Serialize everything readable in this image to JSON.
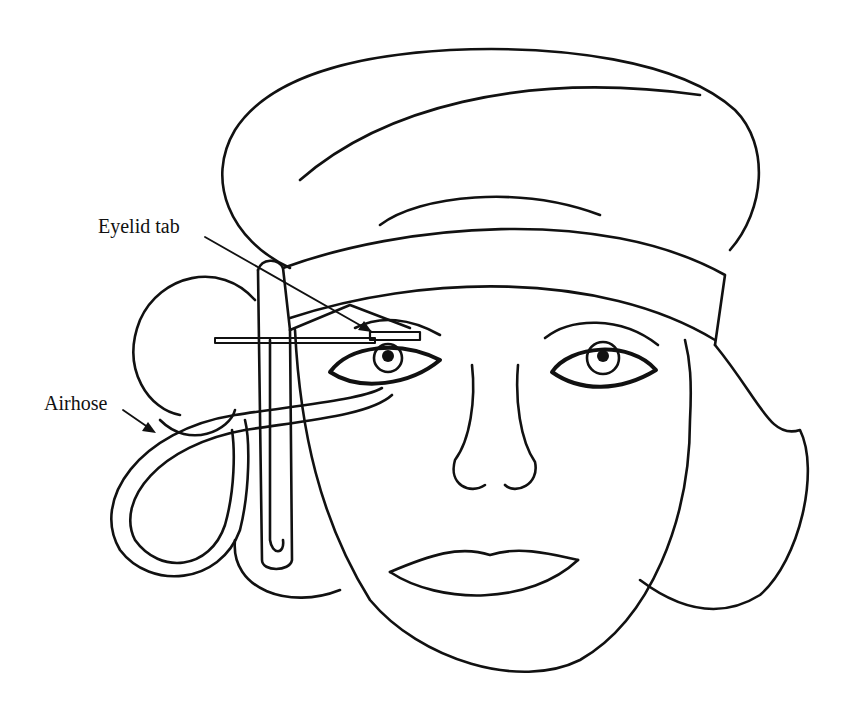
{
  "figure": {
    "type": "line-art illustration",
    "labels": [
      {
        "id": "eyelid-tab",
        "text": "Eyelid tab"
      },
      {
        "id": "airhose",
        "text": "Airhose"
      }
    ],
    "colors": {
      "ink": "#111111",
      "background": "#ffffff"
    }
  }
}
